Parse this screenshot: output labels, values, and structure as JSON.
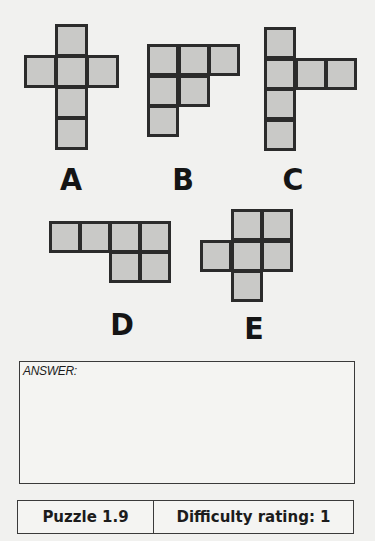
{
  "colors": {
    "background": "#f1f1ef",
    "cell_fill": "#c9c9c7",
    "cell_border": "#2b2b2b"
  },
  "shapes": [
    {
      "label": "A",
      "origin": [
        24,
        24
      ],
      "cell_size": 32.5,
      "cells": [
        [
          1,
          0
        ],
        [
          0,
          1
        ],
        [
          1,
          1
        ],
        [
          2,
          1
        ],
        [
          1,
          2
        ],
        [
          1,
          3
        ]
      ],
      "label_pos": [
        51,
        165
      ]
    },
    {
      "label": "B",
      "origin": [
        147,
        44
      ],
      "cell_size": 32,
      "cells": [
        [
          0,
          0
        ],
        [
          1,
          0
        ],
        [
          2,
          0
        ],
        [
          0,
          1
        ],
        [
          1,
          1
        ],
        [
          0,
          2
        ]
      ],
      "label_pos": [
        163,
        165
      ]
    },
    {
      "label": "C",
      "origin": [
        264,
        27
      ],
      "cell_size": 32,
      "cells": [
        [
          0,
          0
        ],
        [
          0,
          1
        ],
        [
          1,
          1
        ],
        [
          2,
          1
        ],
        [
          0,
          2
        ],
        [
          0,
          3
        ]
      ],
      "label_pos": [
        273,
        165
      ]
    },
    {
      "label": "D",
      "origin": [
        49,
        221
      ],
      "cell_size": 31.5,
      "cells": [
        [
          0,
          0
        ],
        [
          1,
          0
        ],
        [
          2,
          0
        ],
        [
          3,
          0
        ],
        [
          2,
          1
        ],
        [
          3,
          1
        ]
      ],
      "label_pos": [
        102,
        310
      ]
    },
    {
      "label": "E",
      "origin": [
        200,
        209
      ],
      "cell_size": 32,
      "cells": [
        [
          1,
          0
        ],
        [
          2,
          0
        ],
        [
          0,
          1
        ],
        [
          1,
          1
        ],
        [
          2,
          1
        ],
        [
          1,
          2
        ]
      ],
      "label_pos": [
        234,
        314
      ]
    }
  ],
  "answer": {
    "label": "ANSWER:",
    "value": ""
  },
  "footer": {
    "puzzle": "Puzzle 1.9",
    "difficulty": "Difficulty rating: 1"
  }
}
